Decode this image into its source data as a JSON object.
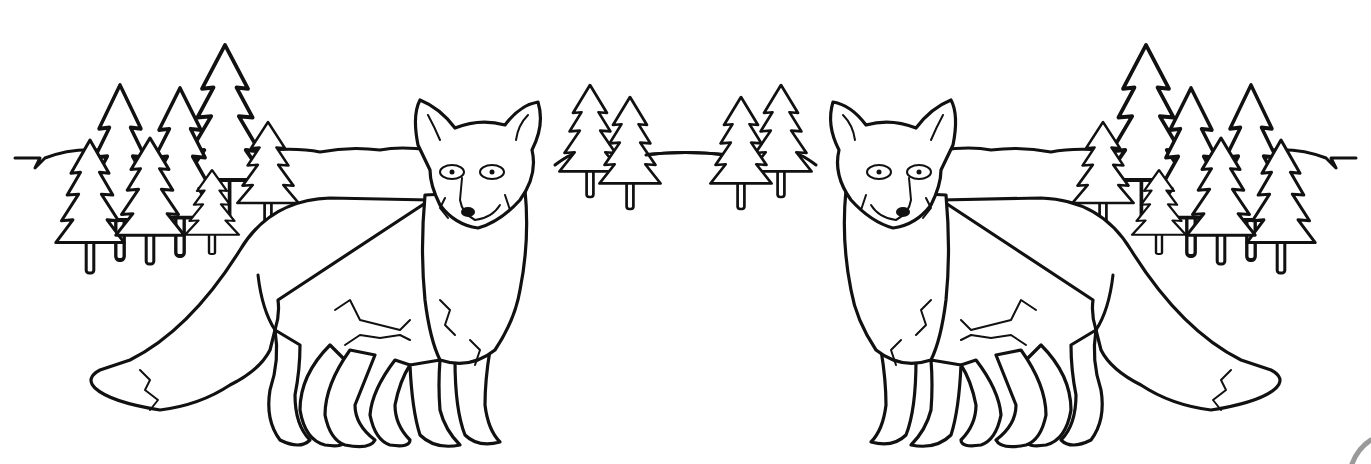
{
  "image": {
    "title": "Two foxes in a forest coloring page",
    "style": "black line art on white",
    "colors": {
      "background": "#ffffff",
      "line": "#111111",
      "corner_mark": "#9a9a9a"
    }
  },
  "scene": {
    "subjects": [
      {
        "name": "left fox",
        "facing": "viewer, body to the left"
      },
      {
        "name": "right fox",
        "facing": "viewer, body to the right (mirror of left fox)"
      }
    ],
    "background": {
      "left_tree_cluster": 7,
      "center_left_trees": 2,
      "center_right_trees": 2,
      "right_tree_cluster": 7,
      "horizon_line": true
    }
  }
}
